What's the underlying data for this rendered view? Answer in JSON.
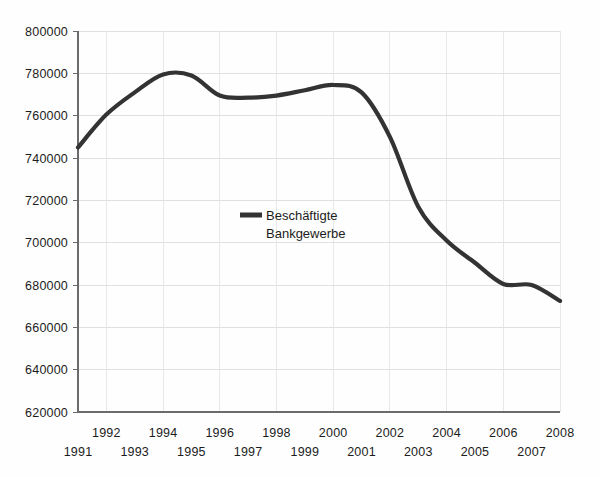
{
  "chart_data": {
    "type": "line",
    "title": "",
    "subtitle": "",
    "xlabel": "",
    "ylabel": "",
    "grid": true,
    "legend_position": "inside-center-left",
    "x": [
      1991,
      1992,
      1993,
      1994,
      1995,
      1996,
      1997,
      1998,
      1999,
      2000,
      2001,
      2002,
      2003,
      2004,
      2005,
      2006,
      2007,
      2008
    ],
    "categories": [
      "1991",
      "1992",
      "1993",
      "1994",
      "1995",
      "1996",
      "1997",
      "1998",
      "1999",
      "2000",
      "2001",
      "2002",
      "2003",
      "2004",
      "2005",
      "2006",
      "2007",
      "2008"
    ],
    "series": [
      {
        "name": "Beschäftigte Bankgewerbe",
        "color": "#333333",
        "values": [
          745000,
          760500,
          771000,
          779500,
          779000,
          769500,
          768500,
          769500,
          772000,
          774500,
          771000,
          750000,
          717000,
          701000,
          690500,
          680500,
          680000,
          672500
        ]
      }
    ],
    "xlim": [
      1991,
      2008
    ],
    "ylim": [
      620000,
      800000
    ],
    "ytick_values": [
      620000,
      640000,
      660000,
      680000,
      700000,
      720000,
      740000,
      760000,
      780000,
      800000
    ],
    "ytick_labels": [
      "620000",
      "640000",
      "660000",
      "680000",
      "700000",
      "720000",
      "740000",
      "760000",
      "780000",
      "800000"
    ],
    "xtick_labels_upper": [
      "1992",
      "1994",
      "1996",
      "1998",
      "2000",
      "2002",
      "2004",
      "2006",
      "2008"
    ],
    "xtick_labels_lower": [
      "1991",
      "1993",
      "1995",
      "1997",
      "1999",
      "2001",
      "2003",
      "2005",
      "2007"
    ]
  },
  "legend": {
    "line_1": "Beschäftigte",
    "line_2": "Bankgewerbe",
    "marker_name": "legend-line-swatch"
  },
  "colors": {
    "series_line": "#333333",
    "grid": "#d8d8d8",
    "axis": "#6b6b6b",
    "background": "#fefefe",
    "text": "#1c1c1c"
  }
}
